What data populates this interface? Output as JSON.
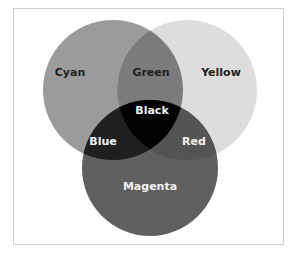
{
  "diagram": {
    "type": "venn-3-set",
    "title": "",
    "colors": {
      "cyan": "#9b9b9b",
      "yellow": "#dddddd",
      "magenta": "#5f5f5f",
      "green": "#7b7b7b",
      "red": "#545454",
      "blue": "#1f1f1f",
      "black": "#020202",
      "frame_border": "#cfcfcf",
      "dark_text": "#1e1e1e",
      "light_text": "#f2f2f2"
    },
    "sets": [
      {
        "id": "cyan",
        "label": "Cyan"
      },
      {
        "id": "yellow",
        "label": "Yellow"
      },
      {
        "id": "magenta",
        "label": "Magenta"
      }
    ],
    "intersections": [
      {
        "sets": [
          "cyan",
          "yellow"
        ],
        "label": "Green"
      },
      {
        "sets": [
          "cyan",
          "magenta"
        ],
        "label": "Blue"
      },
      {
        "sets": [
          "yellow",
          "magenta"
        ],
        "label": "Red"
      },
      {
        "sets": [
          "cyan",
          "yellow",
          "magenta"
        ],
        "label": "Black"
      }
    ]
  }
}
